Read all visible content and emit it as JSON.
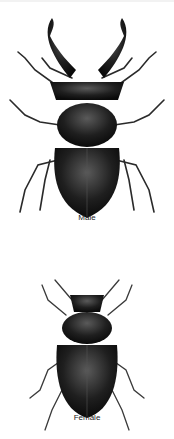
{
  "figures": [
    {
      "id": "male",
      "label": "Male",
      "subject": "stag beetle (male) with large mandibles"
    },
    {
      "id": "female",
      "label": "Female",
      "subject": "stag beetle (female) with small mandibles"
    }
  ],
  "colors": {
    "background": "#ffffff",
    "beetle_body": "#1a1a1a",
    "highlight": "#5a5a5a",
    "label_text": "#222222"
  }
}
